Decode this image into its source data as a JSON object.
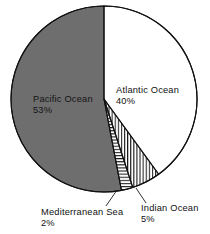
{
  "chart_data": {
    "type": "pie",
    "title": "",
    "categories": [
      "Atlantic Ocean",
      "Indian Ocean",
      "Mediterranean Sea",
      "Pacific Ocean"
    ],
    "values": [
      40,
      5,
      2,
      53
    ],
    "unit": "%",
    "start_angle_deg": 0,
    "direction": "clockwise",
    "legend": "none",
    "labels_inline": true,
    "slices": [
      {
        "name": "Atlantic Ocean",
        "value": 40,
        "value_label": "40%",
        "fill": "white",
        "fill_color": "#ffffff",
        "label_placement": "inside",
        "label_x": 116,
        "label_y": 93,
        "value_x": 116,
        "value_y": 104
      },
      {
        "name": "Indian Ocean",
        "value": 5,
        "value_label": "5%",
        "fill": "vertical-hatch",
        "fill_color": "#ffffff",
        "hatch_color": "#111111",
        "label_placement": "outside",
        "label_x": 141,
        "label_y": 211,
        "value_x": 141,
        "value_y": 222,
        "leader": {
          "x1": 136,
          "y1": 188,
          "x2": 146,
          "y2": 203
        }
      },
      {
        "name": "Mediterranean Sea",
        "value": 2,
        "value_label": "2%",
        "fill": "horizontal-hatch",
        "fill_color": "#ffffff",
        "hatch_color": "#111111",
        "label_placement": "outside",
        "label_x": 41,
        "label_y": 215,
        "value_x": 41,
        "value_y": 226,
        "leader": {
          "x1": 117,
          "y1": 190,
          "x2": 106,
          "y2": 206
        }
      },
      {
        "name": "Pacific Ocean",
        "value": 53,
        "value_label": "53%",
        "fill": "solid-gray",
        "fill_color": "#6e6e6e",
        "label_placement": "inside",
        "label_x": 33,
        "label_y": 102,
        "value_x": 33,
        "value_y": 113
      }
    ],
    "geometry": {
      "center_x": 104,
      "center_y": 99,
      "radius": 93,
      "outline_color": "#111111",
      "outline_width": 1.1
    }
  }
}
